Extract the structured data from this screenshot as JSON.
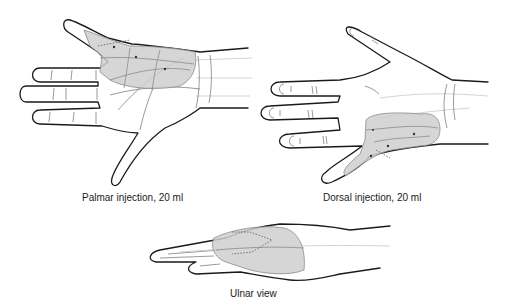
{
  "figure": {
    "panels": [
      {
        "id": "palmar",
        "caption": "Palmar injection, 20 ml"
      },
      {
        "id": "dorsal",
        "caption": "Dorsal injection, 20 ml"
      },
      {
        "id": "ulnar",
        "caption": "Ulnar view"
      }
    ],
    "colors": {
      "background": "#ffffff",
      "outline": "#1a1a1a",
      "injection_zone": "#cfcfcf",
      "caption_text": "#222222"
    }
  }
}
